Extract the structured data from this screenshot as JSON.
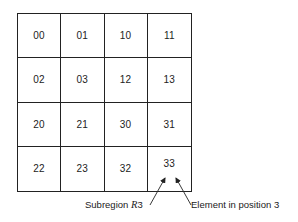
{
  "diagram": {
    "type": "quadtree-grid",
    "rows": [
      [
        "00",
        "01",
        "10",
        "11"
      ],
      [
        "02",
        "03",
        "12",
        "13"
      ],
      [
        "20",
        "21",
        "30",
        "31"
      ],
      [
        "22",
        "23",
        "32",
        "33"
      ]
    ],
    "annotations": {
      "left": {
        "prefix": "Subregion ",
        "italic": "R",
        "suffix": "3"
      },
      "right": {
        "text": "Element in position 3"
      }
    }
  }
}
